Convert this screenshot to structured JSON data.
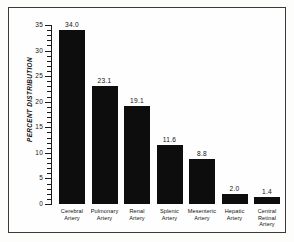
{
  "chart_data": {
    "type": "bar",
    "title": "",
    "xlabel": "",
    "ylabel": "PERCENT DISTRIBUTION",
    "ylim": [
      0,
      35
    ],
    "grid": false,
    "legend": false,
    "y_major_ticks": [
      "0",
      "5",
      "10",
      "15",
      "20",
      "25",
      "30",
      "35"
    ],
    "y_major_tick_values": [
      0,
      5,
      10,
      15,
      20,
      25,
      30,
      35
    ],
    "y_minor_tick_step": 1,
    "categories": [
      "Cerebral Artery",
      "Pulmonary Artery",
      "Renal Artery",
      "Splenic Artery",
      "Mesenteric Artery",
      "Hepatic Artery",
      "Central Retinal Artery"
    ],
    "category_lines": [
      [
        "Cerebral",
        "Artery"
      ],
      [
        "Pulmonary",
        "Artery"
      ],
      [
        "Renal",
        "Artery"
      ],
      [
        "Splenic",
        "Artery"
      ],
      [
        "Mesenteric",
        "Artery"
      ],
      [
        "Hepatic",
        "Artery"
      ],
      [
        "Central",
        "Retinal",
        "Artery"
      ]
    ],
    "values": [
      34.0,
      23.1,
      19.1,
      11.6,
      8.8,
      2.0,
      1.4
    ],
    "value_labels": [
      "34.0",
      "23.1",
      "19.1",
      "11.6",
      "8.8",
      "2.0",
      "1.4"
    ],
    "bar_color": "#0d0d0d",
    "axis_color": "#1b1b1b",
    "text_color": "#121212",
    "background_color": "#fefefe"
  }
}
